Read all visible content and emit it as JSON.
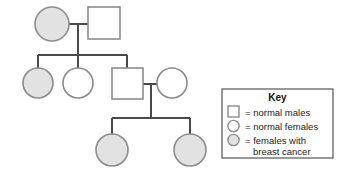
{
  "diagram": {
    "background_color": "#ffffff",
    "line_color": "#4a4a4a",
    "shape_stroke_color": "#8c8c8c",
    "affected_fill_color": "#e2e2e2",
    "unaffected_fill_color": "#ffffff",
    "generations": [
      {
        "id": "generation-1",
        "individuals": [
          {
            "id": "I-1",
            "sex": "female",
            "status": "affected",
            "shape": "circle",
            "cx": 52,
            "cy": 24,
            "r": 17
          },
          {
            "id": "I-2",
            "sex": "male",
            "status": "normal",
            "shape": "square",
            "x": 88,
            "y": 7,
            "size": 32
          }
        ]
      },
      {
        "id": "generation-2",
        "individuals": [
          {
            "id": "II-1",
            "sex": "female",
            "status": "affected",
            "shape": "circle",
            "cx": 38,
            "cy": 83,
            "r": 15
          },
          {
            "id": "II-2",
            "sex": "female",
            "status": "normal",
            "shape": "circle",
            "cx": 78,
            "cy": 83,
            "r": 15
          },
          {
            "id": "II-3",
            "sex": "male",
            "status": "normal",
            "shape": "square",
            "x": 112,
            "y": 68,
            "size": 31
          },
          {
            "id": "II-4",
            "sex": "female",
            "status": "normal",
            "shape": "circle",
            "cx": 172,
            "cy": 83,
            "r": 15
          }
        ]
      },
      {
        "id": "generation-3",
        "individuals": [
          {
            "id": "III-1",
            "sex": "female",
            "status": "affected",
            "shape": "circle",
            "cx": 112,
            "cy": 150,
            "r": 16
          },
          {
            "id": "III-2",
            "sex": "female",
            "status": "affected",
            "shape": "circle",
            "cx": 190,
            "cy": 150,
            "r": 16
          }
        ]
      }
    ],
    "matings": [
      {
        "id": "mating-1",
        "partners": [
          "I-1",
          "I-2"
        ],
        "line_y": 24,
        "x_start": 69,
        "x_end": 88
      },
      {
        "id": "mating-2",
        "partners": [
          "II-3",
          "II-4"
        ],
        "line_y": 84,
        "x_start": 143,
        "x_end": 157
      }
    ],
    "sibships": [
      {
        "id": "sibship-1",
        "bar_y": 55,
        "x_start": 38,
        "x_end": 127,
        "drop_from_x": 78,
        "drop_from_y": 24,
        "children": [
          "II-1",
          "II-2",
          "II-3"
        ]
      },
      {
        "id": "sibship-2",
        "bar_y": 118,
        "x_start": 112,
        "x_end": 190,
        "drop_from_x": 151,
        "drop_from_y": 84,
        "children": [
          "III-1",
          "III-2"
        ]
      }
    ]
  },
  "key": {
    "title": "Key",
    "box": {
      "x": 222,
      "y": 89,
      "width": 111,
      "height": 69
    },
    "entries": [
      {
        "id": "key-normal-males",
        "symbol": "square",
        "status": "normal",
        "label": "= normal males"
      },
      {
        "id": "key-normal-females",
        "symbol": "circle",
        "status": "normal",
        "label": "= normal females"
      },
      {
        "id": "key-affected-females",
        "symbol": "circle",
        "status": "affected",
        "label_line1": "= females with",
        "label_line2": "breast cancer"
      }
    ]
  }
}
